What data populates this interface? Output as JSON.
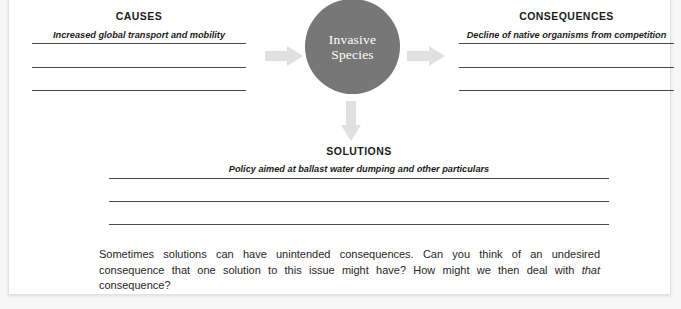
{
  "worksheet": {
    "central_node": {
      "label_line1": "Invasive",
      "label_line2": "Species",
      "fill_color": "#777777",
      "text_color": "#ffffff"
    },
    "arrows": [
      {
        "name": "causes-to-node",
        "direction": "right",
        "color": "#e0e0e0"
      },
      {
        "name": "node-to-consequences",
        "direction": "right",
        "color": "#e0e0e0"
      },
      {
        "name": "node-to-solutions",
        "direction": "down",
        "color": "#e0e0e0"
      }
    ],
    "sections": [
      {
        "id": "causes",
        "heading": "CAUSES",
        "filled_answer": "Increased global transport and mobility",
        "blank_line_count": 2
      },
      {
        "id": "consequences",
        "heading": "CONSEQUENCES",
        "filled_answer": "Decline of native organisms from competition",
        "blank_line_count": 2
      },
      {
        "id": "solutions",
        "heading": "SOLUTIONS",
        "filled_answer": "Policy aimed at ballast water dumping and other particulars",
        "blank_line_count": 2
      }
    ],
    "prompt": {
      "part1": "Sometimes solutions can have unintended consequences. Can you think of an undesired consequence that one solution to this issue might have? How might we then deal with ",
      "emphasis": "that",
      "part2": " consequence?"
    }
  }
}
